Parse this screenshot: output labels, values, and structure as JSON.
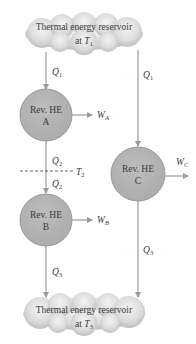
{
  "reservoirs": {
    "top": {
      "line1": "Thermal energy reservoir",
      "line2_prefix": "at ",
      "temp_symbol": "T",
      "temp_sub": "1"
    },
    "bottom": {
      "line1": "Thermal energy reservoir",
      "line2_prefix": "at ",
      "temp_symbol": "T",
      "temp_sub": "3"
    }
  },
  "engines": {
    "A": {
      "line1": "Rev. HE",
      "line2": "A"
    },
    "B": {
      "line1": "Rev. HE",
      "line2": "B"
    },
    "C": {
      "line1": "Rev. HE",
      "line2": "C"
    }
  },
  "heat_flows": {
    "q1_left": {
      "symbol": "Q",
      "sub": "1"
    },
    "q1_right": {
      "symbol": "Q",
      "sub": "1"
    },
    "q2_upper": {
      "symbol": "Q",
      "sub": "2"
    },
    "q2_lower": {
      "symbol": "Q",
      "sub": "2"
    },
    "q3_left": {
      "symbol": "Q",
      "sub": "3"
    },
    "q3_right": {
      "symbol": "Q",
      "sub": "3"
    }
  },
  "work_outputs": {
    "WA": {
      "symbol": "W",
      "sub": "A"
    },
    "WB": {
      "symbol": "W",
      "sub": "B"
    },
    "WC": {
      "symbol": "W",
      "sub": "C"
    }
  },
  "intermediate_temp": {
    "symbol": "T",
    "sub": "2"
  },
  "colors": {
    "engine_fill": "#b5b5b5",
    "engine_stroke": "#8a8a8a",
    "line": "#9a9a9a",
    "text": "#3a3a3a"
  }
}
